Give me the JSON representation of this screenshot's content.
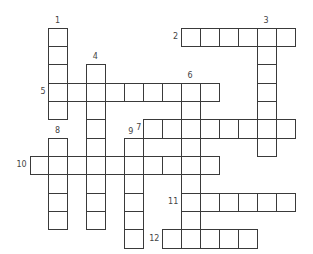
{
  "puzzle": {
    "type": "crossword",
    "origin": {
      "x": 29.5,
      "y": 27.5
    },
    "cell_w": 18.95,
    "cell_h": 18.35,
    "entries": [
      {
        "number": "1",
        "direction": "down",
        "row": 0,
        "col": 1,
        "length": 5,
        "label_pos": "above"
      },
      {
        "number": "2",
        "direction": "across",
        "row": 0,
        "col": 8,
        "length": 6,
        "label_pos": "left"
      },
      {
        "number": "3",
        "direction": "down",
        "row": 0,
        "col": 12,
        "length": 7,
        "label_pos": "above"
      },
      {
        "number": "4",
        "direction": "down",
        "row": 2,
        "col": 3,
        "length": 9,
        "label_pos": "above"
      },
      {
        "number": "5",
        "direction": "across",
        "row": 3,
        "col": 1,
        "length": 9,
        "label_pos": "left"
      },
      {
        "number": "6",
        "direction": "down",
        "row": 3,
        "col": 8,
        "length": 9,
        "label_pos": "above"
      },
      {
        "number": "7",
        "direction": "across",
        "row": 5,
        "col": 6,
        "length": 8,
        "label_pos": "corner"
      },
      {
        "number": "8",
        "direction": "down",
        "row": 6,
        "col": 1,
        "length": 5,
        "label_pos": "above"
      },
      {
        "number": "9",
        "direction": "down",
        "row": 6,
        "col": 5,
        "length": 6,
        "label_pos": "above-left"
      },
      {
        "number": "10",
        "direction": "across",
        "row": 7,
        "col": 0,
        "length": 10,
        "label_pos": "left"
      },
      {
        "number": "11",
        "direction": "across",
        "row": 9,
        "col": 8,
        "length": 6,
        "label_pos": "left"
      },
      {
        "number": "12",
        "direction": "across",
        "row": 11,
        "col": 7,
        "length": 5,
        "label_pos": "left"
      }
    ]
  }
}
